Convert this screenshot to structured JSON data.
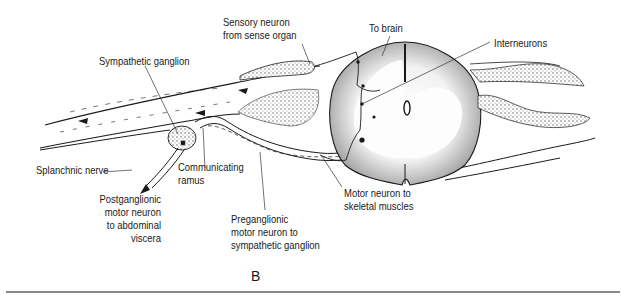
{
  "figure": {
    "panel_letter": "B",
    "labels": {
      "sensory_neuron": [
        "Sensory neuron",
        "from sense organ"
      ],
      "to_brain": "To brain",
      "interneurons": "Interneurons",
      "sympathetic_ganglion": "Sympathetic ganglion",
      "splanchnic_nerve": "Splanchnic nerve",
      "communicating_ramus": [
        "Communicating",
        "ramus"
      ],
      "postganglionic": [
        "Postganglionic",
        "motor neuron",
        "to abdominal",
        "viscera"
      ],
      "preganglionic": [
        "Preganglionic",
        "motor neuron to",
        "sympathetic ganglion"
      ],
      "motor_neuron": [
        "Motor neuron to",
        "skeletal muscles"
      ]
    },
    "colors": {
      "ink": "#1a1a1a",
      "rule": "#8a8a8a",
      "stipple": "#555555"
    }
  }
}
